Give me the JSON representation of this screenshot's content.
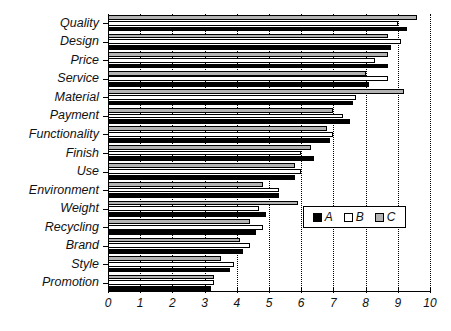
{
  "chart_data": {
    "type": "bar",
    "orientation": "horizontal",
    "title": "",
    "xlabel": "",
    "ylabel": "",
    "xlim": [
      0,
      10
    ],
    "xticks": [
      0,
      1,
      2,
      3,
      4,
      5,
      6,
      7,
      8,
      9,
      10
    ],
    "xtick_labels": [
      "0",
      "1",
      "2",
      "3",
      "4",
      "5",
      "6",
      "7",
      "8",
      "9",
      "10"
    ],
    "grid": "vertical-dotted",
    "legend_position": "lower-right-inside",
    "categories": [
      "Quality",
      "Design",
      "Price",
      "Service",
      "Material",
      "Payment",
      "Functionality",
      "Finish",
      "Use",
      "Environment",
      "Weight",
      "Recycling",
      "Brand",
      "Style",
      "Promotion"
    ],
    "series": [
      {
        "name": "A",
        "color": "#000000",
        "values": [
          9.3,
          8.8,
          8.7,
          8.1,
          7.6,
          7.5,
          6.9,
          6.4,
          5.8,
          5.3,
          4.9,
          4.6,
          4.2,
          3.8,
          3.2
        ]
      },
      {
        "name": "B",
        "color": "#ffffff",
        "values": [
          9.0,
          9.1,
          8.3,
          8.7,
          7.7,
          7.3,
          7.0,
          6.0,
          6.0,
          5.3,
          4.7,
          4.8,
          4.4,
          3.9,
          3.3
        ]
      },
      {
        "name": "C",
        "color": "#b3b3b3",
        "values": [
          9.6,
          8.7,
          8.7,
          8.0,
          9.2,
          7.0,
          6.8,
          6.3,
          5.8,
          4.8,
          5.9,
          4.4,
          4.1,
          3.5,
          3.3
        ]
      }
    ]
  },
  "legend": {
    "items": [
      {
        "label": "A",
        "key": "A"
      },
      {
        "label": "B",
        "key": "B"
      },
      {
        "label": "C",
        "key": "C"
      }
    ]
  }
}
